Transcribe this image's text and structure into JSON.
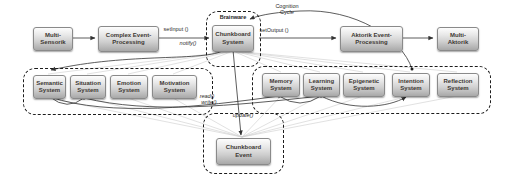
{
  "diagram_title": "Brainware cognitive architecture diagram",
  "colors": {
    "node_fill_top": "#fdfdfd",
    "node_fill_bottom": "#a8a8a8",
    "node_border": "#8a8a8a",
    "dashed_border": "#1c1c1c",
    "connector": "#333333",
    "faint_connector": "#c9c9c9",
    "background": "#ffffff"
  },
  "containers": {
    "brainware": {
      "label": "Brainware"
    },
    "left_systems": {
      "label": ""
    },
    "right_systems": {
      "label": ""
    },
    "chunkboard_event_group": {
      "label": ""
    }
  },
  "nodes": {
    "multi_sensorik": {
      "label": "Multi-\nSensorik"
    },
    "complex_event_processing": {
      "label": "Complex Event-\nProcessing"
    },
    "chunkboard_system": {
      "label": "Chunkboard\nSystem"
    },
    "aktorik_event_processing": {
      "label": "Aktorik Event-\nProcessing"
    },
    "multi_aktorik": {
      "label": "Multi-\nAktorik"
    },
    "semantic_system": {
      "label": "Semantic\nSystem"
    },
    "situation_system": {
      "label": "Situation\nSystem"
    },
    "emotion_system": {
      "label": "Emotion\nSystem"
    },
    "motivation_system": {
      "label": "Motivation\nSystem"
    },
    "memory_system": {
      "label": "Memory\nSystem"
    },
    "learning_system": {
      "label": "Learning\nSystem"
    },
    "epigenetic_system": {
      "label": "Epigenetic\nSystem"
    },
    "intention_system": {
      "label": "Intention\nSystem"
    },
    "reflection_system": {
      "label": "Reflection\nSystem"
    },
    "chunkboard_event": {
      "label": "Chunkboard\nEvent"
    }
  },
  "edge_labels": {
    "set_input": "setInput ()",
    "notify": "notify()",
    "cognition_cycle": "Cognition\nCycle",
    "set_output": "setOutput ()",
    "read": "read()",
    "write": "write()",
    "update": "update()"
  }
}
